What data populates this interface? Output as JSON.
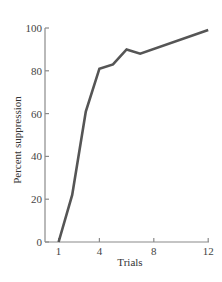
{
  "chart_data": {
    "type": "line",
    "title": "",
    "xlabel": "Trials",
    "ylabel": "Percent suppression",
    "x": [
      1,
      2,
      3,
      4,
      5,
      6,
      7,
      12
    ],
    "series": [
      {
        "name": "Percent suppression",
        "values": [
          0,
          22,
          61,
          81,
          83,
          90,
          88,
          99
        ]
      }
    ],
    "xticks": [
      1,
      4,
      8,
      12
    ],
    "yticks": [
      0,
      20,
      40,
      60,
      80,
      100
    ],
    "xlim": [
      0,
      12
    ],
    "ylim": [
      0,
      100
    ],
    "grid": false,
    "legend": null,
    "line_color": "#555555",
    "axis_color": "#8a8a8a"
  }
}
